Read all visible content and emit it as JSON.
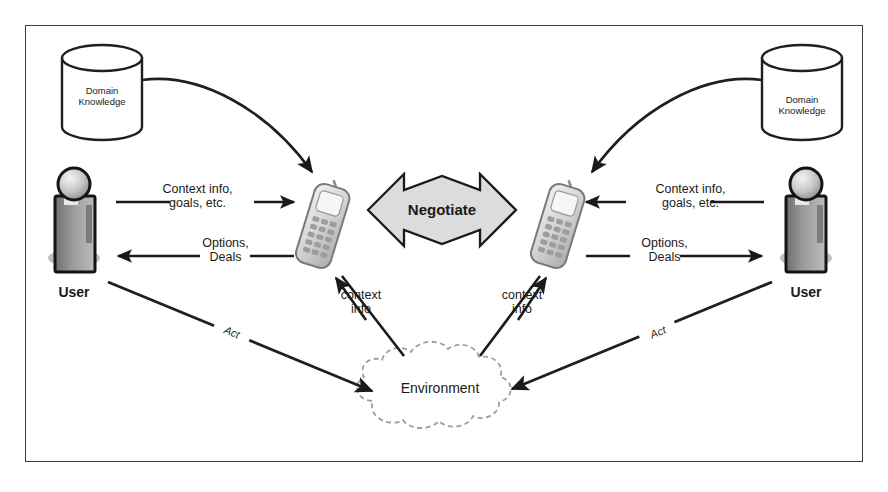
{
  "diagram": {
    "frame": {
      "border_color": "#3c3c3c"
    },
    "nodes": {
      "db_left": {
        "label": "Domain\nKnowledge",
        "icon": "database-cylinder-icon"
      },
      "db_right": {
        "label": "Domain\nKnowledge",
        "icon": "database-cylinder-icon"
      },
      "user_left": {
        "label": "User",
        "icon": "user-person-icon"
      },
      "user_right": {
        "label": "User",
        "icon": "user-person-icon"
      },
      "phone_left": {
        "label": "",
        "icon": "mobile-phone-icon"
      },
      "phone_right": {
        "label": "",
        "icon": "mobile-phone-icon"
      },
      "negotiate": {
        "label": "Negotiate",
        "icon": "double-headed-arrow-icon",
        "fill": "#dcdcdc"
      },
      "environment": {
        "label": "Environment",
        "icon": "cloud-icon"
      }
    },
    "edges": {
      "left_to_phone": {
        "label": "Context info,\ngoals, etc."
      },
      "phone_to_left": {
        "label": "Options,\nDeals"
      },
      "right_to_phone": {
        "label": "Context info,\ngoals, etc."
      },
      "phone_to_right": {
        "label": "Options,\nDeals"
      },
      "env_to_phone_left": {
        "label": "context\ninfo"
      },
      "env_to_phone_right": {
        "label": "context\ninfo"
      },
      "user_left_to_env": {
        "label": "Act"
      },
      "user_right_to_env": {
        "label": "Act"
      },
      "db_left_to_phone": {
        "label": ""
      },
      "db_right_to_phone": {
        "label": ""
      }
    }
  }
}
